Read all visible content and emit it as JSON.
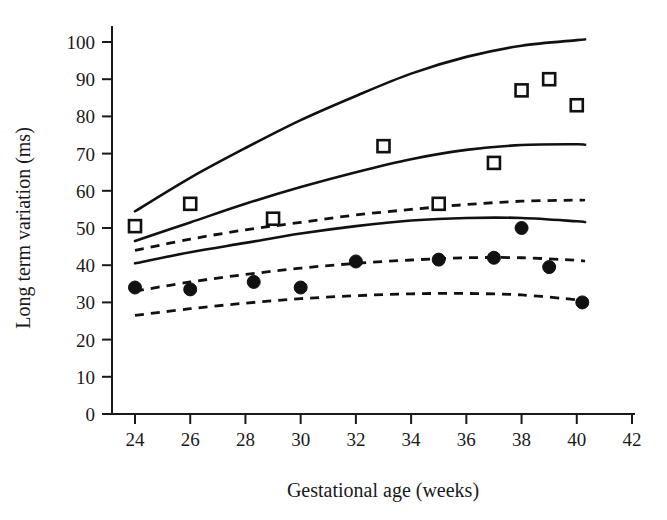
{
  "chart_data": {
    "type": "scatter",
    "title": "",
    "xlabel": "Gestational age (weeks)",
    "ylabel": "Long term variation (ms)",
    "xlim": [
      23,
      42
    ],
    "ylim": [
      0,
      104
    ],
    "xticks": [
      24,
      26,
      28,
      30,
      32,
      34,
      36,
      38,
      40,
      42
    ],
    "yticks": [
      0,
      10,
      20,
      30,
      40,
      50,
      60,
      70,
      80,
      90,
      100
    ],
    "grid": false,
    "legend": "none",
    "series": [
      {
        "name": "open-square-observations",
        "marker": "open-square",
        "points": [
          {
            "x": 24,
            "y": 50.5
          },
          {
            "x": 26,
            "y": 56.5
          },
          {
            "x": 29,
            "y": 52.5
          },
          {
            "x": 33,
            "y": 72.0
          },
          {
            "x": 35,
            "y": 56.5
          },
          {
            "x": 37,
            "y": 67.5
          },
          {
            "x": 38,
            "y": 87.0
          },
          {
            "x": 39,
            "y": 90.0
          },
          {
            "x": 40,
            "y": 83.0
          }
        ]
      },
      {
        "name": "filled-circle-observations",
        "marker": "filled-circle",
        "points": [
          {
            "x": 24,
            "y": 34.0
          },
          {
            "x": 26,
            "y": 33.5
          },
          {
            "x": 28.3,
            "y": 35.5
          },
          {
            "x": 30,
            "y": 34.0
          },
          {
            "x": 32,
            "y": 41.0
          },
          {
            "x": 35,
            "y": 41.5
          },
          {
            "x": 37,
            "y": 42.0
          },
          {
            "x": 38,
            "y": 50.0
          },
          {
            "x": 39,
            "y": 39.5
          },
          {
            "x": 40.2,
            "y": 30.0
          }
        ]
      }
    ],
    "curves": [
      {
        "name": "solid-upper-reference",
        "style": "solid",
        "points": [
          {
            "x": 24,
            "y": 54.5
          },
          {
            "x": 26,
            "y": 63.5
          },
          {
            "x": 28,
            "y": 71.5
          },
          {
            "x": 30,
            "y": 79.0
          },
          {
            "x": 32,
            "y": 85.5
          },
          {
            "x": 34,
            "y": 91.5
          },
          {
            "x": 36,
            "y": 96.0
          },
          {
            "x": 38,
            "y": 99.0
          },
          {
            "x": 40,
            "y": 100.5
          },
          {
            "x": 40.3,
            "y": 100.7
          }
        ]
      },
      {
        "name": "solid-middle-reference",
        "style": "solid",
        "points": [
          {
            "x": 24,
            "y": 46.5
          },
          {
            "x": 26,
            "y": 51.5
          },
          {
            "x": 28,
            "y": 56.5
          },
          {
            "x": 30,
            "y": 61.0
          },
          {
            "x": 32,
            "y": 65.0
          },
          {
            "x": 34,
            "y": 68.5
          },
          {
            "x": 36,
            "y": 71.0
          },
          {
            "x": 38,
            "y": 72.3
          },
          {
            "x": 40,
            "y": 72.5
          },
          {
            "x": 40.3,
            "y": 72.4
          }
        ]
      },
      {
        "name": "solid-lower-reference",
        "style": "solid",
        "points": [
          {
            "x": 24,
            "y": 40.5
          },
          {
            "x": 26,
            "y": 43.5
          },
          {
            "x": 28,
            "y": 46.0
          },
          {
            "x": 30,
            "y": 48.5
          },
          {
            "x": 32,
            "y": 50.5
          },
          {
            "x": 34,
            "y": 52.0
          },
          {
            "x": 36,
            "y": 52.7
          },
          {
            "x": 38,
            "y": 52.7
          },
          {
            "x": 40,
            "y": 51.8
          },
          {
            "x": 40.3,
            "y": 51.6
          }
        ]
      },
      {
        "name": "dashed-upper-reference",
        "style": "dashed",
        "points": [
          {
            "x": 24,
            "y": 44.0
          },
          {
            "x": 26,
            "y": 47.0
          },
          {
            "x": 28,
            "y": 49.5
          },
          {
            "x": 30,
            "y": 51.5
          },
          {
            "x": 32,
            "y": 53.5
          },
          {
            "x": 34,
            "y": 55.0
          },
          {
            "x": 36,
            "y": 56.3
          },
          {
            "x": 38,
            "y": 57.2
          },
          {
            "x": 40,
            "y": 57.5
          },
          {
            "x": 40.3,
            "y": 57.5
          }
        ]
      },
      {
        "name": "dashed-middle-reference",
        "style": "dashed",
        "points": [
          {
            "x": 24,
            "y": 33.0
          },
          {
            "x": 26,
            "y": 35.5
          },
          {
            "x": 28,
            "y": 37.5
          },
          {
            "x": 30,
            "y": 39.2
          },
          {
            "x": 32,
            "y": 40.5
          },
          {
            "x": 34,
            "y": 41.4
          },
          {
            "x": 36,
            "y": 42.0
          },
          {
            "x": 38,
            "y": 42.0
          },
          {
            "x": 40,
            "y": 41.3
          },
          {
            "x": 40.3,
            "y": 41.1
          }
        ]
      },
      {
        "name": "dashed-lower-reference",
        "style": "dashed",
        "points": [
          {
            "x": 24,
            "y": 26.5
          },
          {
            "x": 26,
            "y": 28.3
          },
          {
            "x": 28,
            "y": 29.8
          },
          {
            "x": 30,
            "y": 31.0
          },
          {
            "x": 32,
            "y": 31.8
          },
          {
            "x": 34,
            "y": 32.3
          },
          {
            "x": 36,
            "y": 32.4
          },
          {
            "x": 38,
            "y": 32.0
          },
          {
            "x": 40,
            "y": 30.7
          },
          {
            "x": 40.3,
            "y": 30.4
          }
        ]
      }
    ]
  },
  "axes": {
    "x_label": "Gestational age (weeks)",
    "y_label": "Long term variation (ms)",
    "x_tick_labels": [
      "24",
      "26",
      "28",
      "30",
      "32",
      "34",
      "36",
      "38",
      "40",
      "42"
    ],
    "y_tick_labels": [
      "0",
      "10",
      "20",
      "30",
      "40",
      "50",
      "60",
      "70",
      "80",
      "90",
      "100"
    ]
  },
  "colors": {
    "ink": "#111111",
    "background": "#ffffff"
  }
}
